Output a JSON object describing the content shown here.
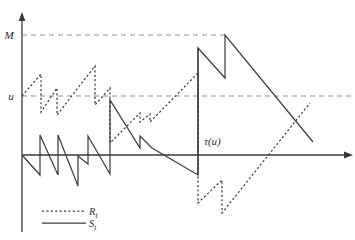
{
  "figure": {
    "title": "",
    "background_color": "#ffffff",
    "axis_color": "#3a3a3a",
    "level_line_color": "#8d8d8d",
    "curve_color": "#3f3f3f"
  },
  "labels": {
    "level_M": "M",
    "level_u": "u",
    "tau": "τ(u)"
  },
  "legend": {
    "items": [
      {
        "name": "R",
        "label": "R",
        "subscript": "t",
        "style": "dashed"
      },
      {
        "name": "S",
        "label": "S",
        "subscript": "t",
        "style": "solid"
      }
    ]
  },
  "chart_data": {
    "type": "line",
    "title": "",
    "xlabel": "",
    "ylabel": "",
    "grid": false,
    "legend_position": "bottom-left",
    "axes": {
      "origin_px": [
        22,
        155
      ],
      "x_axis_end_px": [
        352,
        155
      ],
      "y_axis_top_px": [
        22,
        14
      ],
      "x_range_px": [
        22,
        352
      ],
      "y_range_px": [
        14,
        232
      ]
    },
    "reference_levels": [
      {
        "name": "M",
        "label": "M",
        "y_px": 35,
        "x_from_px": 22,
        "x_to_px": 226,
        "style": "dashed"
      },
      {
        "name": "u",
        "label": "u",
        "y_px": 96,
        "x_from_px": 22,
        "x_to_px": 352,
        "style": "dashed"
      }
    ],
    "annotations": [
      {
        "name": "tau-vertical",
        "x_px": 198,
        "y_from_px": 175,
        "y_to_px": 48,
        "style": "solid"
      },
      {
        "name": "tau-label",
        "text": "τ(u)",
        "x_px": 204,
        "y_px": 145
      }
    ],
    "series": [
      {
        "name": "S_t",
        "label": "S",
        "style": "solid",
        "description": "Surplus process: sawtooth with downward drift and upward jumps",
        "points_px": [
          [
            22,
            155
          ],
          [
            40,
            175
          ],
          [
            40,
            135
          ],
          [
            58,
            175
          ],
          [
            58,
            135
          ],
          [
            78,
            186
          ],
          [
            78,
            156
          ],
          [
            88,
            164
          ],
          [
            88,
            136
          ],
          [
            110,
            174
          ],
          [
            110,
            100
          ],
          [
            140,
            148
          ],
          [
            140,
            136
          ],
          [
            152,
            148
          ],
          [
            198,
            175
          ],
          [
            198,
            48
          ],
          [
            225,
            78
          ],
          [
            225,
            35
          ],
          [
            313,
            142
          ]
        ]
      },
      {
        "name": "R_t",
        "label": "R",
        "style": "dashed",
        "description": "Reserve process: sawtooth with upward drift and downward jumps",
        "points_px": [
          [
            22,
            96
          ],
          [
            41,
            74
          ],
          [
            41,
            112
          ],
          [
            57,
            88
          ],
          [
            57,
            115
          ],
          [
            95,
            66
          ],
          [
            95,
            105
          ],
          [
            110,
            88
          ],
          [
            110,
            143
          ],
          [
            140,
            113
          ],
          [
            140,
            122
          ],
          [
            150,
            114
          ],
          [
            150,
            122
          ],
          [
            198,
            73
          ],
          [
            198,
            203
          ],
          [
            222,
            180
          ],
          [
            222,
            213
          ],
          [
            310,
            103
          ]
        ]
      }
    ]
  }
}
